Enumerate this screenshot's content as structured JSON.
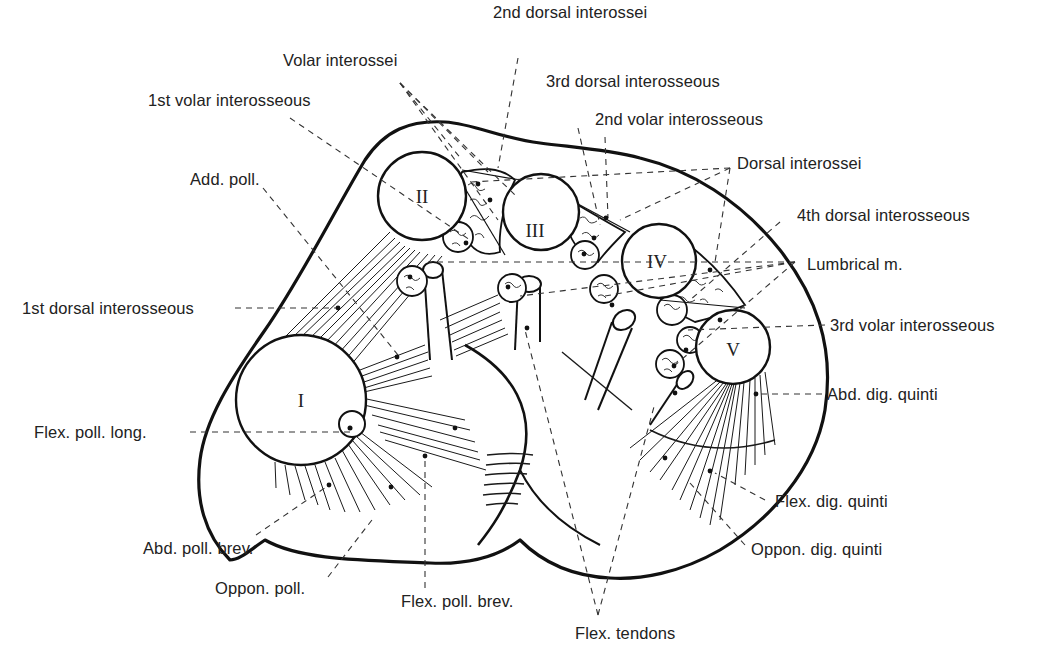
{
  "figure": {
    "bones": [
      {
        "id": "I",
        "label": "I"
      },
      {
        "id": "II",
        "label": "II"
      },
      {
        "id": "III",
        "label": "III"
      },
      {
        "id": "IV",
        "label": "IV"
      },
      {
        "id": "V",
        "label": "V"
      }
    ],
    "labels": {
      "volar_interossei": "Volar interossei",
      "second_dorsal_interossei": "2nd dorsal interossei",
      "third_dorsal_interosseous": "3rd dorsal interosseous",
      "first_volar_interosseous": "1st volar interosseous",
      "second_volar_interosseous": "2nd volar interosseous",
      "add_poll": "Add. poll.",
      "dorsal_interossei": "Dorsal interossei",
      "fourth_dorsal_interosseous": "4th dorsal interosseous",
      "lumbrical": "Lumbrical m.",
      "first_dorsal_interosseous": "1st dorsal interosseous",
      "third_volar_interosseous": "3rd volar interosseous",
      "abd_dig_quinti": "Abd. dig. quinti",
      "flex_poll_long": "Flex. poll. long.",
      "flex_dig_quinti": "Flex. dig. quinti",
      "abd_poll_brev": "Abd. poll. brev.",
      "oppon_dig_quinti": "Oppon. dig. quinti",
      "oppon_poll": "Oppon. poll.",
      "flex_poll_brev": "Flex. poll. brev.",
      "flex_tendons": "Flex. tendons"
    }
  }
}
